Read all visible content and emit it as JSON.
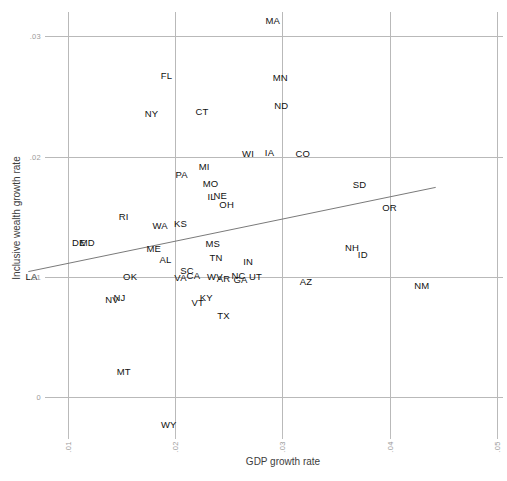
{
  "chart_data": {
    "type": "scatter",
    "title": "",
    "xlabel": "GDP growth rate",
    "ylabel": "Inclusive wealth growth rate",
    "xlim": [
      0.005,
      0.052
    ],
    "ylim": [
      -0.004,
      0.0325
    ],
    "xticks": [
      ".01",
      ".02",
      ".03",
      ".04",
      ".05"
    ],
    "xtick_values": [
      0.01,
      0.02,
      0.03,
      0.04,
      0.05
    ],
    "yticks": [
      ".03",
      ".02",
      ".01",
      "0"
    ],
    "ytick_values": [
      0.03,
      0.02,
      0.01,
      0.0
    ],
    "grid": true,
    "legend": null,
    "point_style": "text-label-only",
    "trendline": {
      "type": "linear",
      "x_start": 0.0063,
      "y_start": 0.01045,
      "x_end": 0.0443,
      "y_end": 0.01745,
      "color": "#7a7a7a"
    },
    "points": [
      {
        "label": "MA",
        "x": 0.0291,
        "y": 0.0314
      },
      {
        "label": "FL",
        "x": 0.0192,
        "y": 0.0268
      },
      {
        "label": "MN",
        "x": 0.0298,
        "y": 0.0266
      },
      {
        "label": "ND",
        "x": 0.0299,
        "y": 0.0243
      },
      {
        "label": "NY",
        "x": 0.0178,
        "y": 0.0236
      },
      {
        "label": "CT",
        "x": 0.0225,
        "y": 0.0238
      },
      {
        "label": "WI",
        "x": 0.0268,
        "y": 0.0203
      },
      {
        "label": "IA",
        "x": 0.0288,
        "y": 0.0204
      },
      {
        "label": "CO",
        "x": 0.0319,
        "y": 0.0203
      },
      {
        "label": "MI",
        "x": 0.0227,
        "y": 0.0192
      },
      {
        "label": "PA",
        "x": 0.0206,
        "y": 0.0186
      },
      {
        "label": "MO",
        "x": 0.0233,
        "y": 0.0178
      },
      {
        "label": "SD",
        "x": 0.0372,
        "y": 0.0177
      },
      {
        "label": "IL",
        "x": 0.0234,
        "y": 0.0167
      },
      {
        "label": "NE",
        "x": 0.0242,
        "y": 0.0168
      },
      {
        "label": "OH",
        "x": 0.0248,
        "y": 0.0161
      },
      {
        "label": "OR",
        "x": 0.04,
        "y": 0.0158
      },
      {
        "label": "RI",
        "x": 0.0152,
        "y": 0.0151
      },
      {
        "label": "WA",
        "x": 0.0186,
        "y": 0.0143
      },
      {
        "label": "KS",
        "x": 0.0205,
        "y": 0.0145
      },
      {
        "label": "DE",
        "x": 0.011,
        "y": 0.0129
      },
      {
        "label": "MD",
        "x": 0.0118,
        "y": 0.0129
      },
      {
        "label": "ME",
        "x": 0.018,
        "y": 0.0124
      },
      {
        "label": "MS",
        "x": 0.0235,
        "y": 0.0128
      },
      {
        "label": "NH",
        "x": 0.0365,
        "y": 0.0125
      },
      {
        "label": "ID",
        "x": 0.0375,
        "y": 0.0119
      },
      {
        "label": "AL",
        "x": 0.0191,
        "y": 0.0115
      },
      {
        "label": "TN",
        "x": 0.0238,
        "y": 0.0117
      },
      {
        "label": "IN",
        "x": 0.0268,
        "y": 0.0113
      },
      {
        "label": "LA",
        "x": 0.0066,
        "y": 0.0101
      },
      {
        "label": "OK",
        "x": 0.0158,
        "y": 0.0101
      },
      {
        "label": "SC",
        "x": 0.0211,
        "y": 0.0106
      },
      {
        "label": "CA",
        "x": 0.0217,
        "y": 0.0102
      },
      {
        "label": "VA",
        "x": 0.0205,
        "y": 0.01
      },
      {
        "label": "WV",
        "x": 0.0237,
        "y": 0.0101
      },
      {
        "label": "AR",
        "x": 0.0245,
        "y": 0.0099
      },
      {
        "label": "NC",
        "x": 0.0259,
        "y": 0.0102
      },
      {
        "label": "GA",
        "x": 0.0261,
        "y": 0.0098
      },
      {
        "label": "UT",
        "x": 0.0275,
        "y": 0.0101
      },
      {
        "label": "AZ",
        "x": 0.0322,
        "y": 0.0097
      },
      {
        "label": "NM",
        "x": 0.043,
        "y": 0.0093
      },
      {
        "label": "NV",
        "x": 0.0141,
        "y": 0.0082
      },
      {
        "label": "NJ",
        "x": 0.0148,
        "y": 0.0083
      },
      {
        "label": "VT",
        "x": 0.0221,
        "y": 0.0079
      },
      {
        "label": "KY",
        "x": 0.0229,
        "y": 0.0083
      },
      {
        "label": "TX",
        "x": 0.0245,
        "y": 0.0068
      },
      {
        "label": "MT",
        "x": 0.0152,
        "y": 0.0022
      },
      {
        "label": "WY",
        "x": 0.0194,
        "y": -0.0022
      }
    ]
  }
}
